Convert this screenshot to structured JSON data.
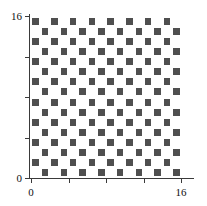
{
  "figure": {
    "background_color": "#ffffff",
    "plot": {
      "left": 31,
      "top": 16,
      "width": 150,
      "height": 162
    }
  },
  "axes": {
    "line_color": "#3a3a3a",
    "x": {
      "label": "",
      "tick_values": [
        0,
        4,
        8,
        12,
        16
      ],
      "tick_labels": [
        "0",
        "",
        "",
        "",
        "16"
      ],
      "range": [
        0,
        16
      ]
    },
    "y": {
      "label": "",
      "tick_values": [
        0,
        4,
        8,
        12,
        16
      ],
      "tick_labels": [
        "0",
        "",
        "",
        "",
        "16"
      ],
      "range": [
        0,
        16
      ]
    }
  },
  "chart_data": {
    "type": "heatmap",
    "title": "",
    "subtitle": "",
    "xlabel": "",
    "ylabel": "",
    "xlim": [
      0,
      16
    ],
    "ylim": [
      0,
      16
    ],
    "xticks": [
      0,
      4,
      8,
      12,
      16
    ],
    "yticks": [
      0,
      4,
      8,
      12,
      16
    ],
    "xticklabels": [
      "0",
      "",
      "",
      "",
      "16"
    ],
    "yticklabels": [
      "0",
      "",
      "",
      "",
      "16"
    ],
    "grid": false,
    "legend": null,
    "nrows": 16,
    "ncols": 16,
    "pattern": "checkerboard",
    "colors": {
      "on": "#4f4f4f",
      "off": "#ffffff"
    },
    "values": [
      [
        1,
        0,
        1,
        0,
        1,
        0,
        1,
        0,
        1,
        0,
        1,
        0,
        1,
        0,
        1,
        0
      ],
      [
        0,
        1,
        0,
        1,
        0,
        1,
        0,
        1,
        0,
        1,
        0,
        1,
        0,
        1,
        0,
        1
      ],
      [
        1,
        0,
        1,
        0,
        1,
        0,
        1,
        0,
        1,
        0,
        1,
        0,
        1,
        0,
        1,
        0
      ],
      [
        0,
        1,
        0,
        1,
        0,
        1,
        0,
        1,
        0,
        1,
        0,
        1,
        0,
        1,
        0,
        1
      ],
      [
        1,
        0,
        1,
        0,
        1,
        0,
        1,
        0,
        1,
        0,
        1,
        0,
        1,
        0,
        1,
        0
      ],
      [
        0,
        1,
        0,
        1,
        0,
        1,
        0,
        1,
        0,
        1,
        0,
        1,
        0,
        1,
        0,
        1
      ],
      [
        1,
        0,
        1,
        0,
        1,
        0,
        1,
        0,
        1,
        0,
        1,
        0,
        1,
        0,
        1,
        0
      ],
      [
        0,
        1,
        0,
        1,
        0,
        1,
        0,
        1,
        0,
        1,
        0,
        1,
        0,
        1,
        0,
        1
      ],
      [
        1,
        0,
        1,
        0,
        1,
        0,
        1,
        0,
        1,
        0,
        1,
        0,
        1,
        0,
        1,
        0
      ],
      [
        0,
        1,
        0,
        1,
        0,
        1,
        0,
        1,
        0,
        1,
        0,
        1,
        0,
        1,
        0,
        1
      ],
      [
        1,
        0,
        1,
        0,
        1,
        0,
        1,
        0,
        1,
        0,
        1,
        0,
        1,
        0,
        1,
        0
      ],
      [
        0,
        1,
        0,
        1,
        0,
        1,
        0,
        1,
        0,
        1,
        0,
        1,
        0,
        1,
        0,
        1
      ],
      [
        1,
        0,
        1,
        0,
        1,
        0,
        1,
        0,
        1,
        0,
        1,
        0,
        1,
        0,
        1,
        0
      ],
      [
        0,
        1,
        0,
        1,
        0,
        1,
        0,
        1,
        0,
        1,
        0,
        1,
        0,
        1,
        0,
        1
      ],
      [
        1,
        0,
        1,
        0,
        1,
        0,
        1,
        0,
        1,
        0,
        1,
        0,
        1,
        0,
        1,
        0
      ],
      [
        0,
        1,
        0,
        1,
        0,
        1,
        0,
        1,
        0,
        1,
        0,
        1,
        0,
        1,
        0,
        1
      ]
    ]
  }
}
